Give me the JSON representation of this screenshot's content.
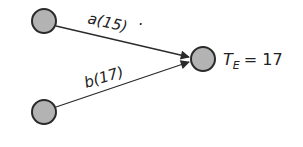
{
  "diagram": {
    "type": "activity-network",
    "nodes": [
      {
        "id": "start-a",
        "cx": 44,
        "cy": 21,
        "r": 12
      },
      {
        "id": "start-b",
        "cx": 44,
        "cy": 112,
        "r": 12
      },
      {
        "id": "end",
        "cx": 203,
        "cy": 59,
        "r": 12
      }
    ],
    "edges": [
      {
        "from": "start-a",
        "to": "end",
        "activity": "a",
        "duration": "15",
        "label": "a(15)"
      },
      {
        "from": "start-b",
        "to": "end",
        "activity": "b",
        "duration": "17",
        "label": "b(17)"
      }
    ],
    "result": {
      "symbol": "T",
      "subscript": "E",
      "equals": "= 17",
      "value": "17"
    },
    "colors": {
      "node_fill": "#b3b3b3",
      "node_stroke": "#2a2a2a",
      "line": "#2a2a2a",
      "text": "#222222"
    }
  }
}
